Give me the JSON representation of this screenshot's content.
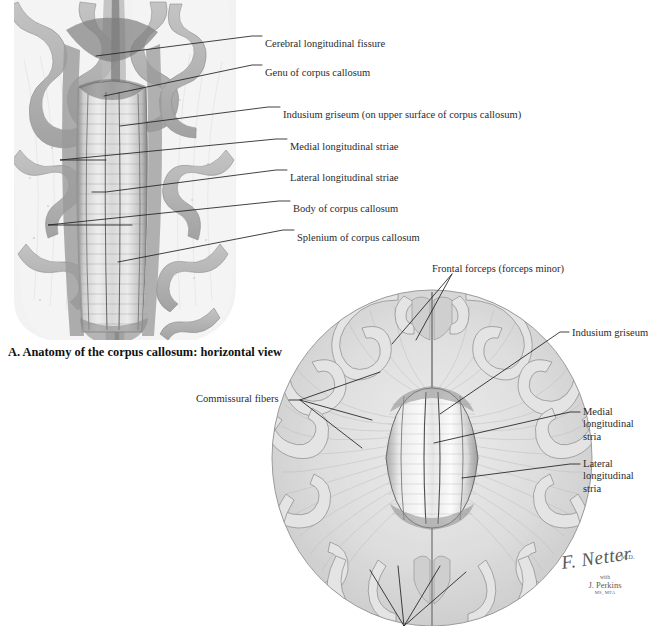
{
  "plate": {
    "title": "Anatomy of the corpus callosum",
    "caption_a": "A. Anatomy of the corpus callosum: horizontal view"
  },
  "figure_a": {
    "name": "horizontal-view-superior-dissection",
    "labels": [
      {
        "id": "cerebral-longitudinal-fissure",
        "text": "Cerebral longitudinal fissure",
        "x": 265,
        "y": 38
      },
      {
        "id": "genu-of-corpus-callosum",
        "text": "Genu of corpus callosum",
        "x": 265,
        "y": 67
      },
      {
        "id": "indusium-griseum",
        "text": "Indusium griseum (on upper surface of corpus callosum)",
        "x": 283,
        "y": 109
      },
      {
        "id": "medial-longitudinal-striae",
        "text": "Medial longitudinal striae",
        "x": 290,
        "y": 141
      },
      {
        "id": "lateral-longitudinal-striae",
        "text": "Lateral longitudinal striae",
        "x": 290,
        "y": 172
      },
      {
        "id": "body-of-corpus-callosum",
        "text": "Body of corpus callosum",
        "x": 293,
        "y": 203
      },
      {
        "id": "splenium-of-corpus-callosum",
        "text": "Splenium of corpus callosum",
        "x": 297,
        "y": 232
      }
    ]
  },
  "figure_b": {
    "name": "horizontal-section-commissural-fibers",
    "labels": [
      {
        "id": "frontal-forceps",
        "text": "Frontal forceps (forceps minor)",
        "x": 432,
        "y": 263
      },
      {
        "id": "indusium-griseum-lower",
        "text": "Indusium griseum",
        "x": 572,
        "y": 334
      },
      {
        "id": "commissural-fibers",
        "text": "Commissural fibers",
        "x": 196,
        "y": 398
      },
      {
        "id": "medial-longitudinal-stria",
        "text": "Medial longitudinal stria",
        "x": 583,
        "y": 415
      },
      {
        "id": "lateral-longitudinal-stria",
        "text": "Lateral longitudinal stria",
        "x": 583,
        "y": 467
      }
    ]
  },
  "signature": {
    "artist": "F. Netter",
    "artist_credentials": "M.D.",
    "with_label": "with",
    "collaborator": "J. Perkins",
    "collaborator_credentials": "MS, MFA"
  },
  "colors": {
    "background": "#ffffff",
    "ink": "#23201e",
    "label_text": "#2b2b2b",
    "cortex_gray": "#b4b4b4",
    "cortex_dark": "#8e8e8e",
    "white_matter": "#dcdcdc",
    "callosum_light": "#f2f2f2",
    "signature_gray": "#5d5a56"
  }
}
